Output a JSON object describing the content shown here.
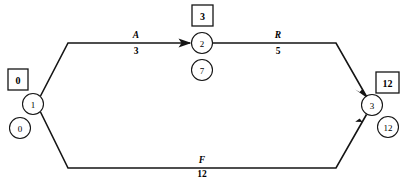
{
  "diagram": {
    "type": "activity-on-arrow-network",
    "nodes": [
      {
        "id": "1",
        "label": "1",
        "cx": 33,
        "cy": 104,
        "r": 10.5
      },
      {
        "id": "2",
        "label": "2",
        "cx": 202,
        "cy": 43,
        "r": 10.5
      },
      {
        "id": "3",
        "label": "3",
        "cx": 372,
        "cy": 105,
        "r": 10.5
      }
    ],
    "badges": [
      {
        "for": "1",
        "value": "0",
        "x": 8,
        "y": 69,
        "w": 20,
        "h": 21
      },
      {
        "for": "2",
        "value": "3",
        "x": 192,
        "y": 5,
        "w": 21,
        "h": 21
      },
      {
        "for": "3",
        "value": "12",
        "x": 376,
        "y": 72,
        "w": 23,
        "h": 21
      }
    ],
    "floats": [
      {
        "for": "1",
        "value": "0",
        "cx": 20,
        "cy": 128,
        "r": 10.5
      },
      {
        "for": "2",
        "value": "7",
        "cx": 202,
        "cy": 70,
        "r": 10.5
      },
      {
        "for": "3",
        "value": "12",
        "cx": 388,
        "cy": 127,
        "r": 10.5
      }
    ],
    "activities": [
      {
        "name": "A",
        "duration": "3",
        "from": "1",
        "to": "2",
        "label_x": 136,
        "name_y": 38,
        "dur_y": 48
      },
      {
        "name": "R",
        "duration": "5",
        "from": "2",
        "to": "3",
        "label_x": 278,
        "name_y": 38,
        "dur_y": 48
      },
      {
        "name": "F",
        "duration": "12",
        "from": "1",
        "to": "3",
        "label_x": 202,
        "name_y": 163,
        "dur_y": 171
      }
    ],
    "colors": {
      "line": "#151515",
      "background": "#ffffff",
      "text": "#000000"
    }
  }
}
